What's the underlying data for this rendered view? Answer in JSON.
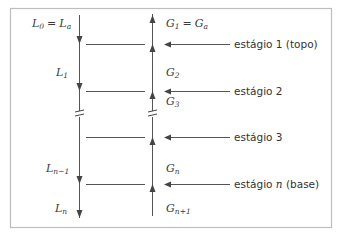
{
  "diagram": {
    "title": "",
    "colors": {
      "line": "#555555",
      "text": "#333333",
      "border": "#b8b8b8",
      "background": "#ffffff"
    },
    "streams": {
      "liquid": {
        "direction": "down",
        "labels": [
          {
            "id": "L0",
            "base": "L",
            "sub": "0",
            "eq_base": "L",
            "eq_sub": "a",
            "text": "L0 = La"
          },
          {
            "id": "L1",
            "base": "L",
            "sub": "1",
            "text": "L1"
          },
          {
            "id": "Ln-1",
            "base": "L",
            "sub": "n−1",
            "text": "Ln−1"
          },
          {
            "id": "Ln",
            "base": "L",
            "sub": "n",
            "text": "Ln"
          }
        ]
      },
      "gas": {
        "direction": "up",
        "labels": [
          {
            "id": "G1",
            "base": "G",
            "sub": "1",
            "eq_base": "G",
            "eq_sub": "a",
            "text": "G1 = Ga"
          },
          {
            "id": "G2",
            "base": "G",
            "sub": "2",
            "text": "G2"
          },
          {
            "id": "G3",
            "base": "G",
            "sub": "3",
            "text": "G3"
          },
          {
            "id": "Gn",
            "base": "G",
            "sub": "n",
            "text": "Gn"
          },
          {
            "id": "Gn+1",
            "base": "G",
            "sub": "n+1",
            "text": "Gn+1"
          }
        ]
      }
    },
    "stages": [
      {
        "id": "stage-1",
        "prefix": "estágio 1 (topo)",
        "italic": "",
        "suffix": ""
      },
      {
        "id": "stage-2",
        "prefix": "estágio 2",
        "italic": "",
        "suffix": ""
      },
      {
        "id": "stage-3",
        "prefix": "estágio 3",
        "italic": "",
        "suffix": ""
      },
      {
        "id": "stage-n",
        "prefix": "estágio ",
        "italic": "n",
        "suffix": " (base)"
      }
    ],
    "eq_sign": "="
  }
}
